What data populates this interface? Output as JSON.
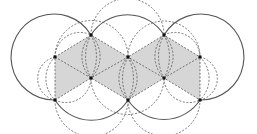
{
  "diagram": {
    "colors": {
      "shade": "#d6d6d6",
      "stroke": "#555555",
      "vertex": "#111111",
      "background": "#ffffff"
    },
    "vertices": [
      {
        "id": "A",
        "x": 55,
        "y": 57
      },
      {
        "id": "B",
        "x": 91,
        "y": 35
      },
      {
        "id": "C",
        "x": 128,
        "y": 57
      },
      {
        "id": "D",
        "x": 164,
        "y": 35
      },
      {
        "id": "E",
        "x": 200,
        "y": 57
      },
      {
        "id": "F",
        "x": 55,
        "y": 100
      },
      {
        "id": "G",
        "x": 91,
        "y": 78
      },
      {
        "id": "H",
        "x": 128,
        "y": 100
      },
      {
        "id": "I",
        "x": 164,
        "y": 78
      },
      {
        "id": "J",
        "x": 200,
        "y": 100
      }
    ],
    "large_circles": [
      {
        "cx": 55,
        "cy": 57,
        "r": 43
      },
      {
        "cx": 128,
        "cy": 57,
        "r": 43
      },
      {
        "cx": 200,
        "cy": 57,
        "r": 43
      },
      {
        "cx": 91,
        "cy": 78,
        "r": 43
      },
      {
        "cx": 164,
        "cy": 78,
        "r": 43
      }
    ]
  }
}
